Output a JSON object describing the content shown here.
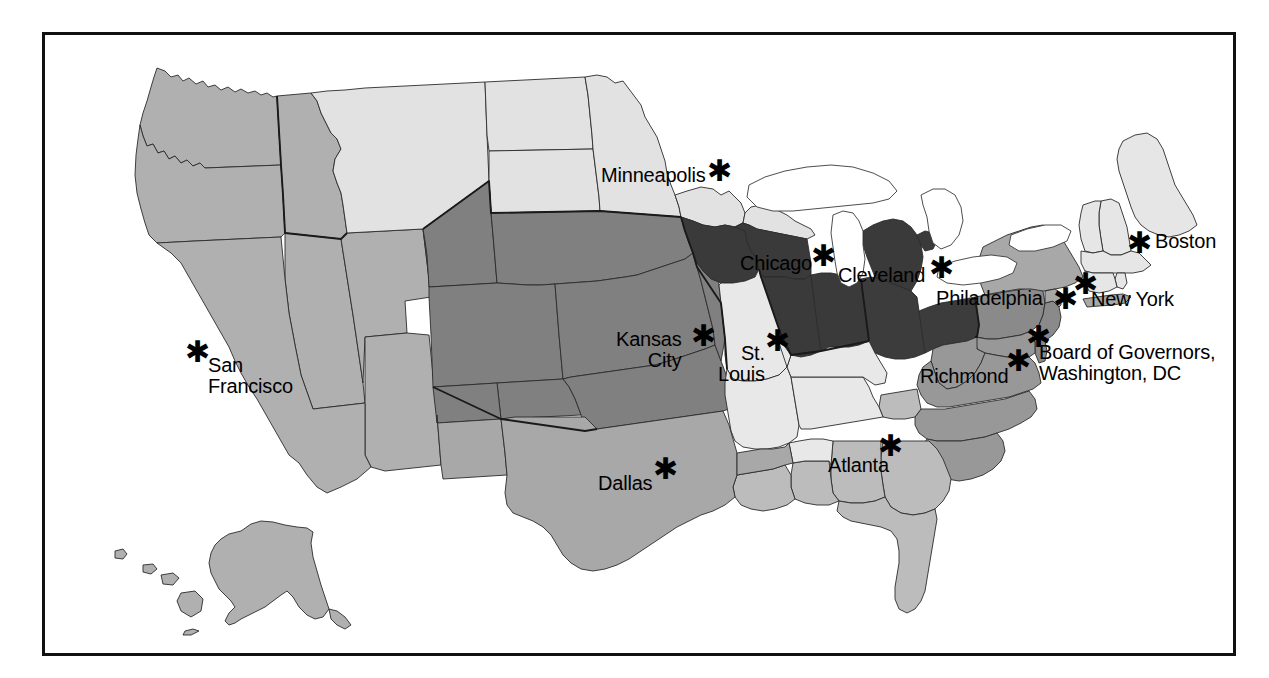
{
  "page": {
    "background_color": "#ffffff",
    "frame_color": "#111111",
    "width": 1269,
    "height": 678
  },
  "map": {
    "type": "choropleth-region-map",
    "region": "United States",
    "projection_note": "Contiguous US with Alaska and Hawaii insets",
    "districts": [
      {
        "id": "boston",
        "name": "Boston",
        "number": 1,
        "fill": "#e6e6e6",
        "states": "ME, NH, VT, MA, RI, CT"
      },
      {
        "id": "new-york",
        "name": "New York",
        "number": 2,
        "fill": "#a8a8a8",
        "states": "NY, northern NJ"
      },
      {
        "id": "philadelphia",
        "name": "Philadelphia",
        "number": 3,
        "fill": "#8a8a8a",
        "states": "eastern PA, southern NJ, DE"
      },
      {
        "id": "cleveland",
        "name": "Cleveland",
        "number": 4,
        "fill": "#3c3c3c",
        "states": "OH, western PA, eastern KY, WV panhandle"
      },
      {
        "id": "richmond",
        "name": "Richmond",
        "number": 5,
        "fill": "#989898",
        "states": "VA, WV, NC, SC, MD, DC"
      },
      {
        "id": "atlanta",
        "name": "Atlanta",
        "number": 6,
        "fill": "#bcbcbc",
        "states": "GA, FL, AL, eastern TN, southern MS, southern LA"
      },
      {
        "id": "chicago",
        "name": "Chicago",
        "number": 7,
        "fill": "#3a3a3a",
        "states": "IA, IL, IN, MI, WI"
      },
      {
        "id": "st-louis",
        "name": "St. Louis",
        "number": 8,
        "fill": "#e8e8e8",
        "states": "MO, AR, southern IL, southern IN, western KY, western TN, northern MS"
      },
      {
        "id": "minneapolis",
        "name": "Minneapolis",
        "number": 9,
        "fill": "#e2e2e2",
        "states": "MT, ND, SD, MN, northern WI, UP of MI"
      },
      {
        "id": "kansas-city",
        "name": "Kansas City",
        "number": 10,
        "fill": "#808080",
        "states": "WY, CO, NE, KS, OK, northern NM, western MO"
      },
      {
        "id": "dallas",
        "name": "Dallas",
        "number": 11,
        "fill": "#a8a8a8",
        "states": "TX, southern NM, northern LA"
      },
      {
        "id": "san-francisco",
        "name": "San Francisco",
        "number": 12,
        "fill": "#b0b0b0",
        "states": "WA, OR, ID, NV, UT, AZ, CA, AK, HI"
      }
    ],
    "markers": [
      {
        "id": "minneapolis",
        "label": "Minneapolis",
        "label_side": "left",
        "star_x": 713,
        "star_y": 168,
        "label_x": 598,
        "label_y": 162
      },
      {
        "id": "chicago",
        "label": "Chicago",
        "label_side": "left",
        "star_x": 817,
        "star_y": 253,
        "label_x": 737,
        "label_y": 250
      },
      {
        "id": "cleveland",
        "label": "Cleveland",
        "label_side": "left",
        "star_x": 935,
        "star_y": 265,
        "label_x": 835,
        "label_y": 262
      },
      {
        "id": "boston",
        "label": "Boston",
        "label_side": "right",
        "star_x": 1133,
        "star_y": 240,
        "label_x": 1152,
        "label_y": 228
      },
      {
        "id": "new-york",
        "label": "New York",
        "label_side": "right",
        "star_x": 1079,
        "star_y": 281,
        "label_x": 1088,
        "label_y": 286
      },
      {
        "id": "philadelphia",
        "label": "Philadelphia",
        "label_side": "left",
        "star_x": 1059,
        "star_y": 296,
        "label_x": 933,
        "label_y": 285
      },
      {
        "id": "kansas-city",
        "label": "Kansas\nCity",
        "label_side": "left",
        "star_x": 697,
        "star_y": 333,
        "label_x": 613,
        "label_y": 326
      },
      {
        "id": "st-louis",
        "label": "St.\nLouis",
        "label_side": "left",
        "star_x": 771,
        "star_y": 338,
        "label_x": 715,
        "label_y": 340
      },
      {
        "id": "san-francisco",
        "label": "San\nFrancisco",
        "label_side": "right",
        "star_x": 191,
        "star_y": 349,
        "label_x": 205,
        "label_y": 352
      },
      {
        "id": "richmond",
        "label": "Richmond",
        "label_side": "left",
        "star_x": 1012,
        "star_y": 358,
        "label_x": 917,
        "label_y": 363
      },
      {
        "id": "board-of-governors",
        "label": "Board of Governors,\nWashington, DC",
        "label_side": "right",
        "star_x": 1032,
        "star_y": 334,
        "label_x": 1036,
        "label_y": 339
      },
      {
        "id": "atlanta",
        "label": "Atlanta",
        "label_side": "left",
        "star_x": 884,
        "star_y": 443,
        "label_x": 825,
        "label_y": 452
      },
      {
        "id": "dallas",
        "label": "Dallas",
        "label_side": "left",
        "star_x": 659,
        "star_y": 466,
        "label_x": 595,
        "label_y": 470
      }
    ],
    "star_glyph": "✱",
    "marker_icon_name": "district-headquarters-star-icon"
  }
}
